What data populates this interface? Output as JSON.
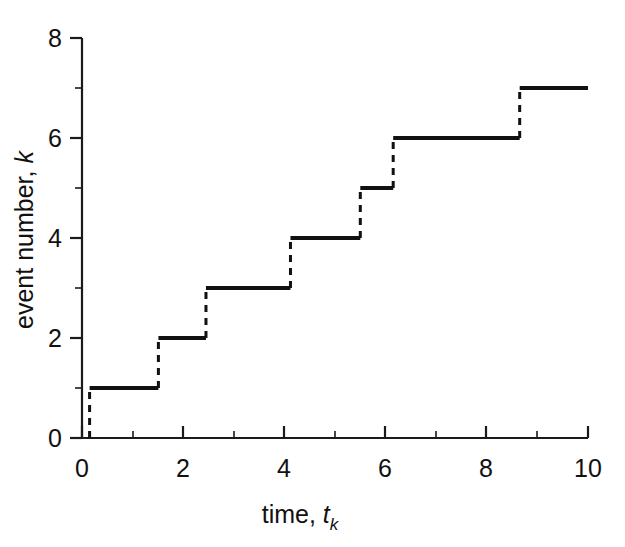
{
  "chart_data": {
    "type": "line",
    "subtype": "step-post",
    "title": "",
    "xlabel": "time, t_k",
    "ylabel": "event number, k",
    "xlim": [
      0,
      10
    ],
    "ylim": [
      0,
      8
    ],
    "xticks": [
      0,
      2,
      4,
      6,
      8,
      10
    ],
    "xticklabels": [
      "0",
      "2",
      "4",
      "6",
      "8",
      "10"
    ],
    "xminorticks": [
      1,
      3,
      5,
      7,
      9
    ],
    "yticks": [
      0,
      2,
      4,
      6,
      8
    ],
    "yticklabels": [
      "0",
      "2",
      "4",
      "6",
      "8"
    ],
    "yminorticks": [
      1,
      3,
      5,
      7
    ],
    "grid": false,
    "legend": null,
    "line_color": "#111111",
    "event_times": [
      0.15,
      1.51,
      2.45,
      4.12,
      5.5,
      6.15,
      8.65
    ],
    "event_numbers": [
      1,
      2,
      3,
      4,
      5,
      6,
      7
    ],
    "x": [
      0,
      0.15,
      0.15,
      1.51,
      1.51,
      2.45,
      2.45,
      4.12,
      4.12,
      5.5,
      5.5,
      6.15,
      6.15,
      8.65,
      8.65,
      10
    ],
    "y": [
      0,
      0,
      1,
      1,
      2,
      2,
      3,
      3,
      4,
      4,
      5,
      5,
      6,
      6,
      7,
      7
    ],
    "risers_style": "dashed",
    "treads_style": "solid",
    "annotation": ""
  },
  "axes": {
    "x_axis_name": "time-axis",
    "y_axis_name": "event-number-axis"
  },
  "labels": {
    "xlabel_main": "time,",
    "xlabel_var": "t",
    "xlabel_sub": "k",
    "ylabel_main": "event number,",
    "ylabel_var": "k"
  }
}
